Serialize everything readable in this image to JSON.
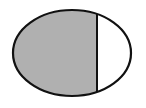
{
  "figure": {
    "shape": "ellipse",
    "ellipse": {
      "cx": 72,
      "cy": 53,
      "rx": 59,
      "ry": 43
    },
    "divider_x": 97,
    "shaded_region": "left",
    "colors": {
      "fill": "#b0b0b0",
      "stroke": "#111111",
      "unshaded": "#ffffff",
      "background": "#ffffff"
    }
  }
}
